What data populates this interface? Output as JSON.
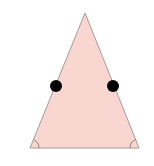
{
  "diagram": {
    "type": "isosceles-triangle",
    "colors": {
      "fill": "#f9d6d0",
      "stroke": "#a89a98",
      "dot": "#000000",
      "arc": "#8c7f7d",
      "background": "#ffffff"
    },
    "vertices": {
      "apex": [
        85,
        13
      ],
      "bottom_left": [
        30,
        148
      ],
      "bottom_right": [
        139,
        148
      ]
    },
    "midpoint_dots": [
      {
        "side": "left",
        "cx": 56,
        "cy": 86,
        "r": 6
      },
      {
        "side": "right",
        "cx": 113,
        "cy": 86,
        "r": 6
      }
    ],
    "angle_marks": [
      {
        "corner": "bottom-left",
        "radius": 9
      },
      {
        "corner": "bottom-right",
        "radius": 9
      }
    ]
  }
}
